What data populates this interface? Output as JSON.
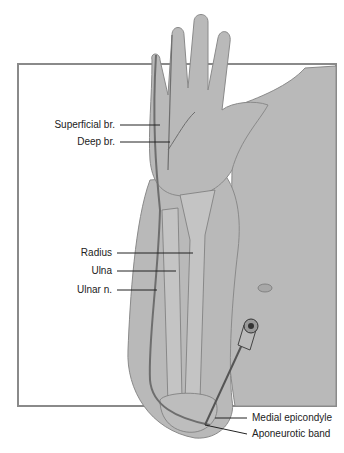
{
  "figure": {
    "colors": {
      "skin": "#b9b9b9",
      "frame": "#8a8a8a",
      "outline": "#6e6e6e",
      "bone": "#c4c4c4",
      "text": "#222222"
    }
  },
  "labels": {
    "superficial_branch": "Superficial br.",
    "deep_branch": "Deep br.",
    "radius": "Radius",
    "ulna": "Ulna",
    "ulnar_nerve": "Ulnar n.",
    "medial_epicondyle": "Medial epicondyle",
    "aponeurotic_band": "Aponeurotic band"
  }
}
